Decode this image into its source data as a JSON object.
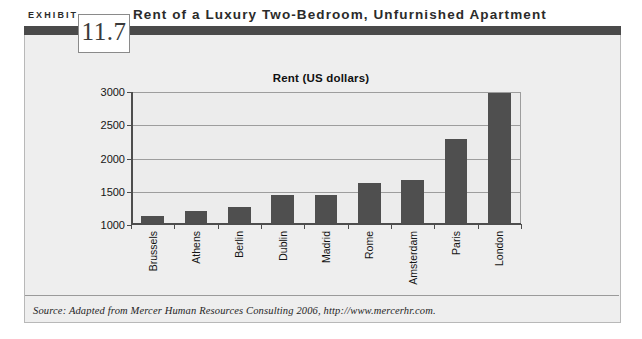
{
  "exhibit": {
    "label": "EXHIBIT",
    "number": "11.7",
    "title": "Rent of a Luxury Two-Bedroom, Unfurnished Apartment",
    "source": "Source: Adapted from Mercer Human Resources Consulting 2006, http://www.mercerhr.com."
  },
  "colors": {
    "bar": "#4f4f4f",
    "header_bar": "#4a4a4a",
    "panel": "#eeeeee",
    "plot_background": "#ececec",
    "gridline": "#9d9d9d",
    "axis": "#4d4d4d"
  },
  "chart_data": {
    "type": "bar",
    "title": "Rent (US dollars)",
    "xlabel": "",
    "ylabel": "",
    "categories": [
      "Brussels",
      "Athens",
      "Berlin",
      "Dublin",
      "Madrid",
      "Rome",
      "Amsterdam",
      "Paris",
      "London"
    ],
    "values": [
      1140,
      1210,
      1270,
      1450,
      1450,
      1630,
      1680,
      2300,
      2990
    ],
    "ylim": [
      1000,
      3000
    ],
    "yticks": [
      1000,
      1500,
      2000,
      2500,
      3000
    ],
    "ytick_labels": [
      "1000",
      "1500",
      "2000",
      "2500",
      "3000"
    ],
    "grid": true,
    "legend": false
  }
}
